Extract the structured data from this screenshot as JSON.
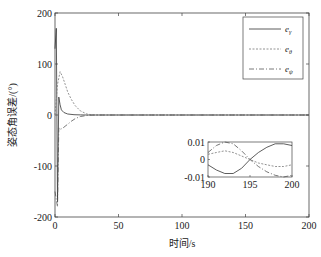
{
  "chart_data": {
    "type": "line",
    "title": "",
    "xlabel": "时间/s",
    "ylabel": "姿态角误差/(°)",
    "xlim": [
      0,
      200
    ],
    "ylim": [
      -200,
      200
    ],
    "xticks": [
      0,
      50,
      100,
      150,
      200
    ],
    "yticks": [
      -200,
      -100,
      0,
      100,
      200
    ],
    "xtick_labels": [
      "0",
      "50",
      "100",
      "150",
      "200"
    ],
    "ytick_labels": [
      "-200",
      "-100",
      "0",
      "100",
      "200"
    ],
    "grid": false,
    "legend_position": "upper right",
    "series": [
      {
        "name": "e_γ",
        "label_base": "e",
        "label_sub": "γ",
        "style": "solid",
        "color": "#333333",
        "x": [
          0,
          1,
          2,
          3,
          4,
          5,
          7,
          10,
          15,
          20,
          25,
          30,
          50,
          100,
          150,
          200
        ],
        "y": [
          130,
          170,
          -170,
          35,
          20,
          10,
          5,
          2,
          0.5,
          0.1,
          0,
          0,
          0,
          0,
          0,
          0
        ]
      },
      {
        "name": "e_θ",
        "label_base": "e",
        "label_sub": "θ",
        "style": "dashed",
        "color": "#777777",
        "x": [
          0,
          2,
          4,
          6,
          8,
          10,
          13,
          16,
          20,
          25,
          30,
          50,
          100,
          150,
          200
        ],
        "y": [
          0,
          60,
          85,
          75,
          60,
          45,
          30,
          18,
          8,
          2,
          0,
          0,
          0,
          0,
          0
        ]
      },
      {
        "name": "e_ψ",
        "label_base": "e",
        "label_sub": "ψ",
        "style": "dashdot",
        "color": "#555555",
        "x": [
          0,
          2,
          3,
          4,
          6,
          8,
          10,
          13,
          16,
          20,
          25,
          30,
          50,
          100,
          150,
          200
        ],
        "y": [
          -150,
          -180,
          -25,
          -28,
          -26,
          -22,
          -18,
          -12,
          -7,
          -3,
          -1,
          0,
          0,
          0,
          0,
          0
        ]
      }
    ],
    "inset": {
      "xlim": [
        190,
        200
      ],
      "ylim": [
        -0.01,
        0.01
      ],
      "xticks": [
        190,
        195,
        200
      ],
      "yticks": [
        -0.01,
        0,
        0.01
      ],
      "xtick_labels": [
        "190",
        "195",
        "200"
      ],
      "ytick_labels": [
        "-0.01",
        "0",
        "0.01"
      ],
      "series": [
        {
          "name": "e_γ",
          "style": "solid",
          "x": [
            190,
            191,
            192,
            193,
            194,
            195,
            196,
            197,
            198,
            199,
            200
          ],
          "y": [
            -0.003,
            -0.006,
            -0.008,
            -0.008,
            -0.005,
            0.0,
            0.004,
            0.007,
            0.009,
            0.009,
            0.008
          ]
        },
        {
          "name": "e_θ",
          "style": "dashed",
          "x": [
            190,
            191,
            192,
            193,
            194,
            195,
            196,
            197,
            198,
            199,
            200
          ],
          "y": [
            0.003,
            0.004,
            0.005,
            0.004,
            0.002,
            0.0,
            -0.002,
            -0.003,
            -0.004,
            -0.004,
            -0.003
          ]
        },
        {
          "name": "e_ψ",
          "style": "dashdot",
          "x": [
            190,
            191,
            192,
            193,
            194,
            195,
            196,
            197,
            198,
            199,
            200
          ],
          "y": [
            0.004,
            0.008,
            0.01,
            0.009,
            0.005,
            0.0,
            -0.004,
            -0.007,
            -0.009,
            -0.01,
            -0.009
          ]
        }
      ]
    }
  }
}
